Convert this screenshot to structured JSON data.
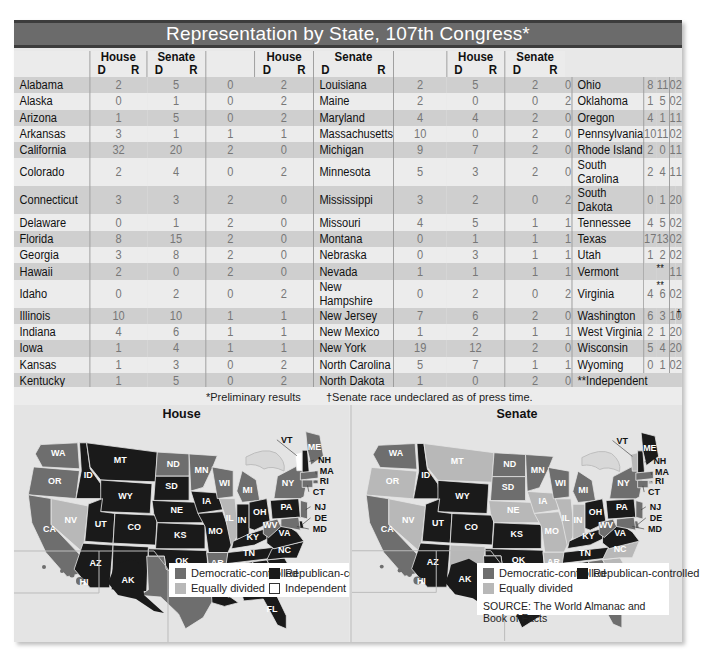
{
  "title": "Representation by State, 107th Congress*",
  "table": {
    "group_headers": [
      "House",
      "Senate"
    ],
    "sub_headers": [
      "D",
      "R"
    ],
    "columns": [
      [
        {
          "state": "Alabama",
          "hd": "2",
          "hr": "5",
          "sd": "0",
          "sr": "2"
        },
        {
          "state": "Alaska",
          "hd": "0",
          "hr": "1",
          "sd": "0",
          "sr": "2"
        },
        {
          "state": "Arizona",
          "hd": "1",
          "hr": "5",
          "sd": "0",
          "sr": "2"
        },
        {
          "state": "Arkansas",
          "hd": "3",
          "hr": "1",
          "sd": "1",
          "sr": "1"
        },
        {
          "state": "California",
          "hd": "32",
          "hr": "20",
          "sd": "2",
          "sr": "0"
        },
        {
          "state": "Colorado",
          "hd": "2",
          "hr": "4",
          "sd": "0",
          "sr": "2"
        },
        {
          "state": "Connecticut",
          "hd": "3",
          "hr": "3",
          "sd": "2",
          "sr": "0"
        },
        {
          "state": "Delaware",
          "hd": "0",
          "hr": "1",
          "sd": "2",
          "sr": "0"
        },
        {
          "state": "Florida",
          "hd": "8",
          "hr": "15",
          "sd": "2",
          "sr": "0"
        },
        {
          "state": "Georgia",
          "hd": "3",
          "hr": "8",
          "sd": "2",
          "sr": "0"
        },
        {
          "state": "Hawaii",
          "hd": "2",
          "hr": "0",
          "sd": "2",
          "sr": "0"
        },
        {
          "state": "Idaho",
          "hd": "0",
          "hr": "2",
          "sd": "0",
          "sr": "2"
        },
        {
          "state": "Illinois",
          "hd": "10",
          "hr": "10",
          "sd": "1",
          "sr": "1"
        },
        {
          "state": "Indiana",
          "hd": "4",
          "hr": "6",
          "sd": "1",
          "sr": "1"
        },
        {
          "state": "Iowa",
          "hd": "1",
          "hr": "4",
          "sd": "1",
          "sr": "1"
        },
        {
          "state": "Kansas",
          "hd": "1",
          "hr": "3",
          "sd": "0",
          "sr": "2"
        },
        {
          "state": "Kentucky",
          "hd": "1",
          "hr": "5",
          "sd": "0",
          "sr": "2"
        }
      ],
      [
        {
          "state": "Louisiana",
          "hd": "2",
          "hr": "5",
          "sd": "2",
          "sr": "0"
        },
        {
          "state": "Maine",
          "hd": "2",
          "hr": "0",
          "sd": "0",
          "sr": "2"
        },
        {
          "state": "Maryland",
          "hd": "4",
          "hr": "4",
          "sd": "2",
          "sr": "0"
        },
        {
          "state": "Massachusetts",
          "hd": "10",
          "hr": "0",
          "sd": "2",
          "sr": "0"
        },
        {
          "state": "Michigan",
          "hd": "9",
          "hr": "7",
          "sd": "2",
          "sr": "0"
        },
        {
          "state": "Minnesota",
          "hd": "5",
          "hr": "3",
          "sd": "2",
          "sr": "0"
        },
        {
          "state": "Mississippi",
          "hd": "3",
          "hr": "2",
          "sd": "0",
          "sr": "2"
        },
        {
          "state": "Missouri",
          "hd": "4",
          "hr": "5",
          "sd": "1",
          "sr": "1"
        },
        {
          "state": "Montana",
          "hd": "0",
          "hr": "1",
          "sd": "1",
          "sr": "1"
        },
        {
          "state": "Nebraska",
          "hd": "0",
          "hr": "3",
          "sd": "1",
          "sr": "1"
        },
        {
          "state": "Nevada",
          "hd": "1",
          "hr": "1",
          "sd": "1",
          "sr": "1"
        },
        {
          "state": "New Hampshire",
          "hd": "0",
          "hr": "2",
          "sd": "0",
          "sr": "2"
        },
        {
          "state": "New Jersey",
          "hd": "7",
          "hr": "6",
          "sd": "2",
          "sr": "0"
        },
        {
          "state": "New Mexico",
          "hd": "1",
          "hr": "2",
          "sd": "1",
          "sr": "1"
        },
        {
          "state": "New York",
          "hd": "19",
          "hr": "12",
          "sd": "2",
          "sr": "0"
        },
        {
          "state": "North Carolina",
          "hd": "5",
          "hr": "7",
          "sd": "1",
          "sr": "1"
        },
        {
          "state": "North Dakota",
          "hd": "1",
          "hr": "0",
          "sd": "2",
          "sr": "0"
        }
      ],
      [
        {
          "state": "Ohio",
          "hd": "8",
          "hr": "11",
          "sd": "0",
          "sr": "2"
        },
        {
          "state": "Oklahoma",
          "hd": "1",
          "hr": "5",
          "sd": "0",
          "sr": "2"
        },
        {
          "state": "Oregon",
          "hd": "4",
          "hr": "1",
          "sd": "1",
          "sr": "1"
        },
        {
          "state": "Pennsylvania",
          "hd": "10",
          "hr": "11",
          "sd": "0",
          "sr": "2"
        },
        {
          "state": "Rhode Island",
          "hd": "2",
          "hr": "0",
          "sd": "1",
          "sr": "1"
        },
        {
          "state": "South Carolina",
          "hd": "2",
          "hr": "4",
          "sd": "1",
          "sr": "1"
        },
        {
          "state": "South Dakota",
          "hd": "0",
          "hr": "1",
          "sd": "2",
          "sr": "0"
        },
        {
          "state": "Tennessee",
          "hd": "4",
          "hr": "5",
          "sd": "0",
          "sr": "2"
        },
        {
          "state": "Texas",
          "hd": "17",
          "hr": "13",
          "sd": "0",
          "sr": "2"
        },
        {
          "state": "Utah",
          "hd": "1",
          "hr": "2",
          "sd": "0",
          "sr": "2"
        },
        {
          "state": "Vermont",
          "hd": "",
          "hr": "",
          "h_mark": "**",
          "sd": "1",
          "sr": "1"
        },
        {
          "state": "Virginia",
          "hd": "4",
          "hr": "6",
          "h_mark": "**",
          "sd": "0",
          "sr": "2"
        },
        {
          "state": "Washington",
          "hd": "6",
          "hr": "3",
          "sd": "1",
          "sr": "0",
          "s_mark": "†"
        },
        {
          "state": "West Virginia",
          "hd": "2",
          "hr": "1",
          "sd": "2",
          "sr": "0"
        },
        {
          "state": "Wisconsin",
          "hd": "5",
          "hr": "4",
          "sd": "2",
          "sr": "0"
        },
        {
          "state": "Wyoming",
          "hd": "0",
          "hr": "1",
          "sd": "0",
          "sr": "2"
        },
        {
          "state": "**Independent",
          "hd": "",
          "hr": "",
          "sd": "",
          "sr": ""
        }
      ]
    ]
  },
  "footnotes": {
    "preliminary": "*Preliminary results",
    "undeclared": "†Senate race undeclared as of press time."
  },
  "maps": {
    "house": {
      "title": "House",
      "legend": [
        "Democratic-controlled",
        "Republican-controlled",
        "Equally divided",
        "Independent"
      ]
    },
    "senate": {
      "title": "Senate",
      "legend": [
        "Democratic-controlled",
        "Republican-controlled",
        "Equally divided"
      ],
      "source": "SOURCE: The World Almanac and Book of Facts"
    }
  },
  "colors": {
    "dem": "#6e6e6e",
    "rep": "#1a1a1a",
    "equal": "#b8b8b8",
    "independent": "#ffffff",
    "title_bar": "#6b6b6b",
    "row_dark": "#cfcfcf",
    "row_light": "#ececec"
  },
  "chart_data": [
    {
      "type": "table",
      "title": "Representation by State, 107th Congress*",
      "columns": [
        "State",
        "House D",
        "House R",
        "Senate D",
        "Senate R"
      ],
      "rows": [
        [
          "Alabama",
          2,
          5,
          0,
          2
        ],
        [
          "Alaska",
          0,
          1,
          0,
          2
        ],
        [
          "Arizona",
          1,
          5,
          0,
          2
        ],
        [
          "Arkansas",
          3,
          1,
          1,
          1
        ],
        [
          "California",
          32,
          20,
          2,
          0
        ],
        [
          "Colorado",
          2,
          4,
          0,
          2
        ],
        [
          "Connecticut",
          3,
          3,
          2,
          0
        ],
        [
          "Delaware",
          0,
          1,
          2,
          0
        ],
        [
          "Florida",
          8,
          15,
          2,
          0
        ],
        [
          "Georgia",
          3,
          8,
          2,
          0
        ],
        [
          "Hawaii",
          2,
          0,
          2,
          0
        ],
        [
          "Idaho",
          0,
          2,
          0,
          2
        ],
        [
          "Illinois",
          10,
          10,
          1,
          1
        ],
        [
          "Indiana",
          4,
          6,
          1,
          1
        ],
        [
          "Iowa",
          1,
          4,
          1,
          1
        ],
        [
          "Kansas",
          1,
          3,
          0,
          2
        ],
        [
          "Kentucky",
          1,
          5,
          0,
          2
        ],
        [
          "Louisiana",
          2,
          5,
          2,
          0
        ],
        [
          "Maine",
          2,
          0,
          0,
          2
        ],
        [
          "Maryland",
          4,
          4,
          2,
          0
        ],
        [
          "Massachusetts",
          10,
          0,
          2,
          0
        ],
        [
          "Michigan",
          9,
          7,
          2,
          0
        ],
        [
          "Minnesota",
          5,
          3,
          2,
          0
        ],
        [
          "Mississippi",
          3,
          2,
          0,
          2
        ],
        [
          "Missouri",
          4,
          5,
          1,
          1
        ],
        [
          "Montana",
          0,
          1,
          1,
          1
        ],
        [
          "Nebraska",
          0,
          3,
          1,
          1
        ],
        [
          "Nevada",
          1,
          1,
          1,
          1
        ],
        [
          "New Hampshire",
          0,
          2,
          0,
          2
        ],
        [
          "New Jersey",
          7,
          6,
          2,
          0
        ],
        [
          "New Mexico",
          1,
          2,
          1,
          1
        ],
        [
          "New York",
          19,
          12,
          2,
          0
        ],
        [
          "North Carolina",
          5,
          7,
          1,
          1
        ],
        [
          "North Dakota",
          1,
          0,
          2,
          0
        ],
        [
          "Ohio",
          8,
          11,
          0,
          2
        ],
        [
          "Oklahoma",
          1,
          5,
          0,
          2
        ],
        [
          "Oregon",
          4,
          1,
          1,
          1
        ],
        [
          "Pennsylvania",
          10,
          11,
          0,
          2
        ],
        [
          "Rhode Island",
          2,
          0,
          1,
          1
        ],
        [
          "South Carolina",
          2,
          4,
          1,
          1
        ],
        [
          "South Dakota",
          0,
          1,
          2,
          0
        ],
        [
          "Tennessee",
          4,
          5,
          0,
          2
        ],
        [
          "Texas",
          17,
          13,
          0,
          2
        ],
        [
          "Utah",
          1,
          2,
          0,
          2
        ],
        [
          "Vermont",
          "**",
          "**",
          1,
          1
        ],
        [
          "Virginia",
          4,
          6,
          0,
          2
        ],
        [
          "Washington",
          6,
          3,
          1,
          0
        ],
        [
          "West Virginia",
          2,
          1,
          2,
          0
        ],
        [
          "Wisconsin",
          5,
          4,
          2,
          0
        ],
        [
          "Wyoming",
          0,
          1,
          0,
          2
        ]
      ],
      "notes": [
        "*Preliminary results",
        "**Independent (Vermont House seat 1 Independent; Virginia 1 Independent)",
        "†Senate race undeclared as of press time (Washington)"
      ]
    },
    {
      "type": "heatmap",
      "title": "House",
      "legend": [
        "Democratic-controlled",
        "Republican-controlled",
        "Equally divided",
        "Independent"
      ],
      "dem": [
        "WA",
        "OR",
        "CA",
        "ND",
        "MN",
        "WI",
        "MI",
        "TX",
        "AR",
        "MS",
        "WV",
        "NY",
        "ME",
        "MA",
        "RI",
        "CT",
        "NJ",
        "MD",
        "HI"
      ],
      "rep": [
        "MT",
        "ID",
        "WY",
        "SD",
        "NE",
        "UT",
        "CO",
        "KS",
        "AZ",
        "NM",
        "OK",
        "IA",
        "MO",
        "IN",
        "OH",
        "KY",
        "TN",
        "AL",
        "GA",
        "LA",
        "SC",
        "NC",
        "VA",
        "PA",
        "FL",
        "NH",
        "DE",
        "AK"
      ],
      "equal": [
        "NV",
        "IL"
      ],
      "independent": [
        "VT"
      ]
    },
    {
      "type": "heatmap",
      "title": "Senate",
      "legend": [
        "Democratic-controlled",
        "Republican-controlled",
        "Equally divided"
      ],
      "dem": [
        "WA",
        "CA",
        "ND",
        "SD",
        "MN",
        "WI",
        "MI",
        "NY",
        "MA",
        "CT",
        "NJ",
        "DE",
        "MD",
        "WV",
        "GA",
        "LA",
        "FL",
        "HI"
      ],
      "rep": [
        "ID",
        "WY",
        "UT",
        "CO",
        "KS",
        "AZ",
        "OK",
        "TX",
        "OH",
        "PA",
        "KY",
        "TN",
        "VA",
        "MS",
        "AL",
        "ME",
        "NH",
        "AK"
      ],
      "equal": [
        "OR",
        "MT",
        "NV",
        "NE",
        "IA",
        "NM",
        "MO",
        "AR",
        "IL",
        "IN",
        "NC",
        "SC",
        "VT",
        "RI"
      ]
    }
  ]
}
